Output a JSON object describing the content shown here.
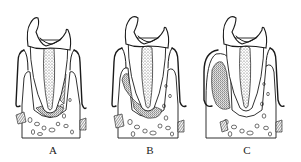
{
  "figure": {
    "panels": [
      {
        "id": "A",
        "label": "A"
      },
      {
        "id": "B",
        "label": "B"
      },
      {
        "id": "C",
        "label": "C"
      }
    ],
    "colors": {
      "ink": "#1a1a1a",
      "background": "#ffffff"
    }
  }
}
